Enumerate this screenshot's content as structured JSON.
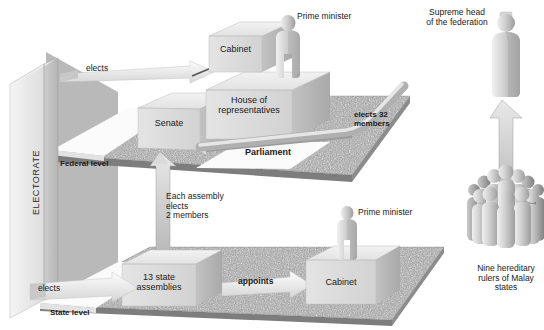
{
  "diagram": {
    "type": "isometric-block-diagram",
    "background_color": "#ffffff",
    "platform_texture_color": "#9a9a9a",
    "block_face_color": "#dcdcdc",
    "arrow_color": "#d8d8d8",
    "text_color": "#1a1a1a"
  },
  "electorate": {
    "label": "ELECTORATE",
    "orientation": "vertical-bottom-to-top"
  },
  "levels": {
    "federal": {
      "label": "Federal level"
    },
    "state": {
      "label": "State level"
    }
  },
  "federal": {
    "cabinet": {
      "label": "Cabinet"
    },
    "prime_minister": {
      "label": "Prime minister"
    },
    "house": {
      "label": "House of\nrepresentatives"
    },
    "senate": {
      "label": "Senate"
    },
    "parliament": {
      "label": "Parliament"
    },
    "elects_32": {
      "label": "elects 32\nmembers"
    },
    "elects_house": {
      "label": "elects"
    }
  },
  "state": {
    "assemblies": {
      "label": "13 state\nassemblies"
    },
    "cabinet": {
      "label": "Cabinet"
    },
    "prime_minister": {
      "label": "Prime minister"
    },
    "elects_assemblies": {
      "label": "elects"
    },
    "appoints": {
      "label": "appoints"
    },
    "each_assembly": {
      "label": "Each assembly\nelects\n2 members"
    }
  },
  "monarchy": {
    "supreme_head": {
      "label": "Supreme head\nof the federation"
    },
    "rulers": {
      "label": "Nine hereditary\nrulers of Malay\nstates"
    }
  }
}
